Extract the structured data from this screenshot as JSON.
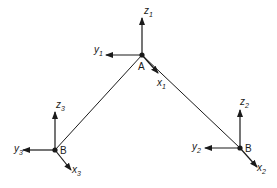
{
  "diagram": {
    "type": "frame-structure-with-local-coordinate-systems",
    "colors": {
      "stroke": "#1a1a1a",
      "background": "#ffffff"
    },
    "nodes": [
      {
        "id": "A",
        "label": "A",
        "x": 142,
        "y": 55,
        "axes": {
          "z": {
            "label": "z",
            "sub": "1"
          },
          "y": {
            "label": "y",
            "sub": "1"
          },
          "x": {
            "label": "x",
            "sub": "1"
          }
        }
      },
      {
        "id": "B_left",
        "label": "B",
        "x": 55,
        "y": 150,
        "axes": {
          "z": {
            "label": "z",
            "sub": "3"
          },
          "y": {
            "label": "y",
            "sub": "3"
          },
          "x": {
            "label": "x",
            "sub": "3"
          }
        }
      },
      {
        "id": "B_right",
        "label": "B",
        "x": 240,
        "y": 148,
        "axes": {
          "z": {
            "label": "z",
            "sub": "2"
          },
          "y": {
            "label": "y",
            "sub": "2"
          },
          "x": {
            "label": "x",
            "sub": "2"
          }
        }
      }
    ],
    "members": [
      {
        "from": "A",
        "to": "B_left"
      },
      {
        "from": "A",
        "to": "B_right"
      }
    ]
  }
}
